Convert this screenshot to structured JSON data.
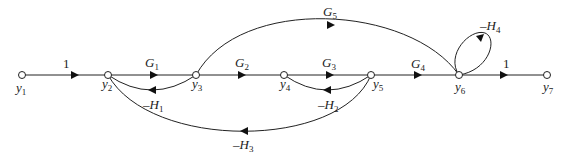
{
  "diagram": {
    "type": "signal-flow-graph",
    "nodes": [
      {
        "id": "y1",
        "label": "y",
        "sub": "1",
        "x": 22,
        "y": 75
      },
      {
        "id": "y2",
        "label": "y",
        "sub": "2",
        "x": 108,
        "y": 75
      },
      {
        "id": "y3",
        "label": "y",
        "sub": "3",
        "x": 196,
        "y": 75
      },
      {
        "id": "y4",
        "label": "y",
        "sub": "4",
        "x": 284,
        "y": 75
      },
      {
        "id": "y5",
        "label": "y",
        "sub": "5",
        "x": 371,
        "y": 75
      },
      {
        "id": "y6",
        "label": "y",
        "sub": "6",
        "x": 459,
        "y": 75
      },
      {
        "id": "y7",
        "label": "y",
        "sub": "7",
        "x": 547,
        "y": 75
      }
    ],
    "edges": [
      {
        "from": "y1",
        "to": "y2",
        "gain": "1",
        "gain_main": "1",
        "gain_sub": ""
      },
      {
        "from": "y2",
        "to": "y3",
        "gain": "G1",
        "gain_main": "G",
        "gain_sub": "1"
      },
      {
        "from": "y3",
        "to": "y4",
        "gain": "G2",
        "gain_main": "G",
        "gain_sub": "2"
      },
      {
        "from": "y4",
        "to": "y5",
        "gain": "G3",
        "gain_main": "G",
        "gain_sub": "3"
      },
      {
        "from": "y5",
        "to": "y6",
        "gain": "G4",
        "gain_main": "G",
        "gain_sub": "4"
      },
      {
        "from": "y6",
        "to": "y7",
        "gain": "1",
        "gain_main": "1",
        "gain_sub": ""
      },
      {
        "from": "y3",
        "to": "y2",
        "gain": "-H1",
        "gain_main": "–H",
        "gain_sub": "1"
      },
      {
        "from": "y5",
        "to": "y4",
        "gain": "-H2",
        "gain_main": "–H",
        "gain_sub": "2"
      },
      {
        "from": "y5",
        "to": "y2",
        "gain": "-H3",
        "gain_main": "–H",
        "gain_sub": "3"
      },
      {
        "from": "y6",
        "to": "y6",
        "gain": "-H4",
        "gain_main": "–H",
        "gain_sub": "4"
      },
      {
        "from": "y3",
        "to": "y6",
        "gain": "G5",
        "gain_main": "G",
        "gain_sub": "5"
      }
    ]
  }
}
